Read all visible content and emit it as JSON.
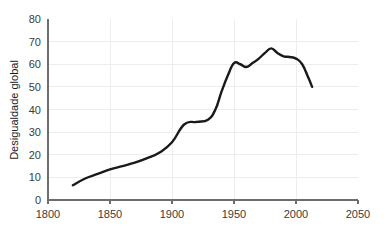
{
  "chart_data": {
    "type": "line",
    "title": "",
    "subtitle": "",
    "xlabel": "",
    "ylabel": "Desigualdade global",
    "xlim": [
      1800,
      2050
    ],
    "ylim": [
      0,
      80
    ],
    "grid": true,
    "legend": "none",
    "x_ticks": [
      "1800",
      "1850",
      "1900",
      "1950",
      "2000",
      "2050"
    ],
    "x_tick_values": [
      1800,
      1850,
      1900,
      1950,
      2000,
      2050
    ],
    "y_ticks": [
      "0",
      "10",
      "20",
      "30",
      "40",
      "50",
      "60",
      "70",
      "80"
    ],
    "y_tick_values": [
      0,
      10,
      20,
      30,
      40,
      50,
      60,
      70,
      80
    ],
    "series": [
      {
        "name": "Desigualdade global",
        "color": "#1a1a1a",
        "x": [
          1820,
          1830,
          1840,
          1850,
          1860,
          1870,
          1880,
          1890,
          1900,
          1910,
          1920,
          1929,
          1935,
          1940,
          1945,
          1950,
          1955,
          1960,
          1965,
          1970,
          1975,
          1980,
          1985,
          1990,
          1995,
          2000,
          2005,
          2010,
          2013
        ],
        "values": [
          6.5,
          9.5,
          11.5,
          13.5,
          15.0,
          16.5,
          18.5,
          21.0,
          25.5,
          33.5,
          34.5,
          35.5,
          40.0,
          48.0,
          55.0,
          60.5,
          60.0,
          58.8,
          60.5,
          62.5,
          65.0,
          67.0,
          65.0,
          63.5,
          63.2,
          62.5,
          60.0,
          54.0,
          50.0
        ]
      }
    ]
  }
}
